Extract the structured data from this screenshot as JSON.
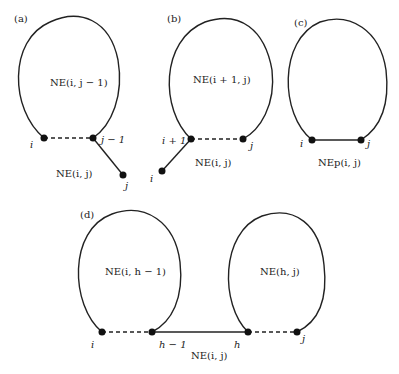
{
  "panels": {
    "a": {
      "tag": "(a)",
      "inner_label": "NE(i, j − 1)",
      "outer_label": "NE(i, j)",
      "nodes": {
        "left": "i",
        "right": "j − 1",
        "tail": "j"
      }
    },
    "b": {
      "tag": "(b)",
      "inner_label": "NE(i + 1, j)",
      "outer_label": "NE(i, j)",
      "nodes": {
        "left": "i + 1",
        "right": "j",
        "tail": "i"
      }
    },
    "c": {
      "tag": "(c)",
      "outer_label": "NEp(i, j)",
      "nodes": {
        "left": "i",
        "right": "j"
      }
    },
    "d": {
      "tag": "(d)",
      "left_inner_label": "NE(i, h − 1)",
      "right_inner_label": "NE(h, j)",
      "outer_label": "NE(i, j)",
      "nodes": {
        "n1": "i",
        "n2": "h − 1",
        "n3": "h",
        "n4": "j"
      }
    }
  }
}
